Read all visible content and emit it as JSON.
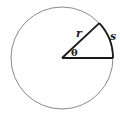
{
  "diagram": {
    "title": "",
    "circle": {
      "cx": 62,
      "cy": 58,
      "r": 51,
      "stroke": "#8a8a8a"
    },
    "angle_deg": 43,
    "colors": {
      "line": "#1a1a1a",
      "circle": "#8a8a8a"
    },
    "labels": {
      "radius": "r",
      "arc": "s",
      "angle": "θ"
    }
  }
}
